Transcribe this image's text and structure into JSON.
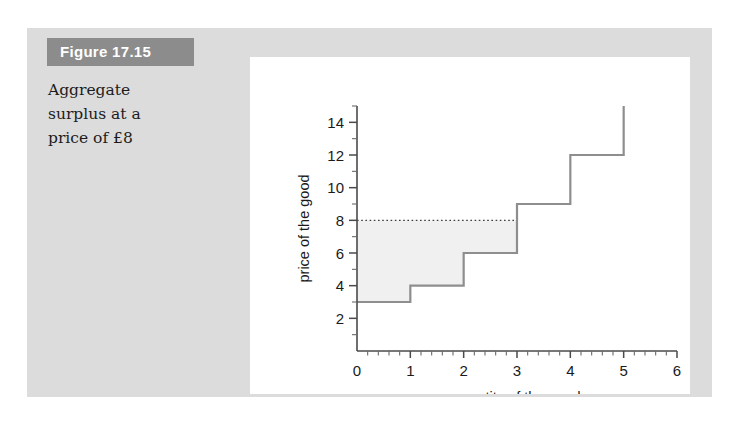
{
  "figure": {
    "label": "Figure 17.15",
    "caption_lines": [
      "Aggregate",
      "surplus at a",
      "price of £8"
    ]
  },
  "colors": {
    "page_background": "#ffffff",
    "figure_background": "#dcdcdc",
    "label_background": "#8c8c8c",
    "label_text": "#ffffff",
    "panel_background": "#ffffff",
    "step_line": "#8e8e8e",
    "surplus_fill": "#f0f0f0",
    "axis": "#4a4a4a",
    "dotted_price_line": "#3d3d3d"
  },
  "chart_data": {
    "type": "bar",
    "title": "",
    "xlabel": "quantity of the good",
    "ylabel": "price of the good",
    "xlim": [
      0,
      6
    ],
    "ylim": [
      0,
      15
    ],
    "xticks": [
      0,
      1,
      2,
      3,
      4,
      5,
      6
    ],
    "yticks": [
      2,
      4,
      6,
      8,
      10,
      12,
      14
    ],
    "x_minor_ticks_per_unit": 5,
    "y_minor_ticks_per_unit": 2,
    "grid": false,
    "legend": null,
    "categories": [
      "1",
      "2",
      "3",
      "4",
      "5"
    ],
    "values": [
      3,
      4,
      6,
      9,
      12
    ],
    "series": [
      {
        "name": "marginal valuation (supply step function)",
        "values": [
          3,
          4,
          6,
          9,
          12
        ]
      }
    ],
    "steps": [
      {
        "x_start": 0,
        "x_end": 1,
        "price": 3
      },
      {
        "x_start": 1,
        "x_end": 2,
        "price": 4
      },
      {
        "x_start": 2,
        "x_end": 3,
        "price": 6
      },
      {
        "x_start": 3,
        "x_end": 4,
        "price": 9
      },
      {
        "x_start": 4,
        "x_end": 5,
        "price": 12
      }
    ],
    "final_riser_top": 15,
    "price_line": {
      "label": "price of £8",
      "value": 8,
      "style": "dotted",
      "x_start": 0,
      "x_end": 3
    },
    "shaded_region": {
      "name": "aggregate surplus",
      "x_start": 0,
      "x_end": 3,
      "upper_value": 8,
      "lower_steps": [
        3,
        4,
        6
      ]
    },
    "annotations": []
  }
}
